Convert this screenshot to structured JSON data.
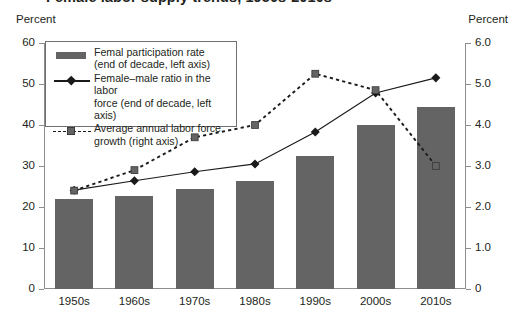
{
  "figure": {
    "title": "Female labor supply trends, 1950s-2010s",
    "left_axis_caption": "Percent",
    "right_axis_caption": "Percent"
  },
  "legend": {
    "items": [
      {
        "key": "bar-swatch",
        "label": "Femal participation rate\n(end of decade, left axis)"
      },
      {
        "key": "solid-line-diamond",
        "label": "Female–male ratio in the labor\nforce (end of decade, left axis)"
      },
      {
        "key": "dashed-line-square",
        "label": "Average annual labor force\ngrowth (right axis)"
      }
    ]
  },
  "axes": {
    "left_ticks": [
      "0",
      "10",
      "20",
      "30",
      "40",
      "50",
      "60"
    ],
    "right_ticks": [
      "0",
      "1.0",
      "2.0",
      "3.0",
      "4.0",
      "5.0",
      "6.0"
    ]
  },
  "colors": {
    "bar_fill": "#646464",
    "line_stroke": "#1a1a1a",
    "square_fill": "#646464",
    "axis": "#8d8d8d",
    "text": "#231f20"
  },
  "chart_data": {
    "type": "bar",
    "title": "Female labor supply trends, 1950s-2010s",
    "xlabel": "",
    "ylabel": "Percent",
    "y2label": "Percent",
    "ylim": [
      0,
      60
    ],
    "y2lim": [
      0,
      6
    ],
    "grid": false,
    "legend_position": "upper-left-inside",
    "categories": [
      "1950s",
      "1960s",
      "1970s",
      "1980s",
      "1990s",
      "2000s",
      "2010s"
    ],
    "series": [
      {
        "name": "Femal participation rate (end of decade, left axis)",
        "type": "bar",
        "axis": "left",
        "values": [
          22.0,
          22.7,
          24.4,
          26.3,
          32.4,
          40.0,
          44.4
        ]
      },
      {
        "name": "Female–male ratio in the labor force (end of decade, left axis)",
        "type": "line",
        "marker": "diamond",
        "linestyle": "solid",
        "axis": "left",
        "values": [
          24.1,
          26.4,
          28.6,
          30.5,
          38.3,
          47.8,
          51.5
        ]
      },
      {
        "name": "Average annual labor force growth (right axis)",
        "type": "line",
        "marker": "square",
        "linestyle": "dashed",
        "axis": "right",
        "values": [
          2.4,
          2.9,
          3.7,
          4.0,
          5.25,
          4.85,
          3.0
        ]
      }
    ]
  }
}
